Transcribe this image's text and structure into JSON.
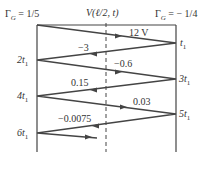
{
  "title_left": "Γ_G = 1/5",
  "title_left_parts": {
    "gamma": "Γ",
    "sub": "G",
    "rest": " = 1/5"
  },
  "title_center": "V(ℓ/2, t)",
  "title_right_parts": {
    "gamma": "Γ",
    "sub": "G",
    "rest": " = − 1/4"
  },
  "time_labels": {
    "t1": "t",
    "t1_sub": "1",
    "t3": "3t",
    "t5": "5t",
    "t2": "2t",
    "t4": "4t",
    "t6": "6t"
  },
  "wave_values": [
    "12 V",
    "−3",
    "−0.6",
    "0.15",
    "0.03",
    "−0.0075"
  ],
  "colors": {
    "line": "#444444",
    "background": "#ffffff"
  }
}
